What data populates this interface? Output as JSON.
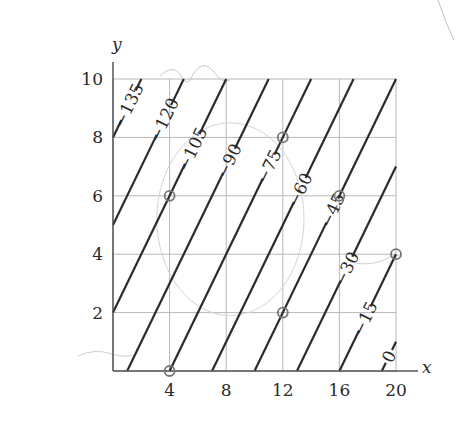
{
  "chart_data": {
    "type": "contour",
    "title": "",
    "xlabel": "x",
    "ylabel": "y",
    "xlim": [
      0,
      20
    ],
    "ylim": [
      0,
      10
    ],
    "x_ticks": [
      4,
      8,
      12,
      16,
      20
    ],
    "y_ticks": [
      2,
      4,
      6,
      8,
      10
    ],
    "grid": true,
    "function_form": "f(x,y) = 5(x - y) - 95",
    "contour_levels": [
      {
        "value": -135,
        "label": "−135",
        "x_minus_y": -8
      },
      {
        "value": -120,
        "label": "−120",
        "x_minus_y": -5
      },
      {
        "value": -105,
        "label": "−105",
        "x_minus_y": -2
      },
      {
        "value": -90,
        "label": "−90",
        "x_minus_y": 1
      },
      {
        "value": -75,
        "label": "−75",
        "x_minus_y": 4
      },
      {
        "value": -60,
        "label": "−60",
        "x_minus_y": 7
      },
      {
        "value": -45,
        "label": "−45",
        "x_minus_y": 10
      },
      {
        "value": -30,
        "label": "−30",
        "x_minus_y": 13
      },
      {
        "value": -15,
        "label": "−15",
        "x_minus_y": 16
      },
      {
        "value": 0,
        "label": "0",
        "x_minus_y": 19
      }
    ],
    "annotations": {
      "circled_points": [
        [
          4,
          6
        ],
        [
          12,
          8
        ],
        [
          16,
          6
        ],
        [
          12,
          2
        ],
        [
          4,
          0
        ],
        [
          20,
          4
        ]
      ],
      "faint_sketch_circle_center": [
        8,
        4
      ]
    }
  }
}
